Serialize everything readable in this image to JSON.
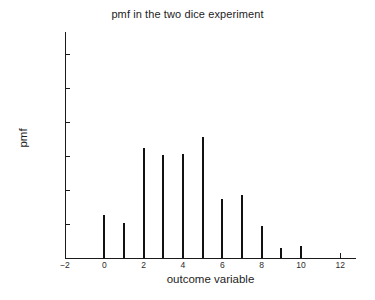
{
  "chart_data": {
    "type": "bar",
    "title": "pmf in the two dice experiment",
    "xlabel": "outcome variable",
    "ylabel": "pmf",
    "categories": [
      0,
      1,
      2,
      3,
      4,
      5,
      6,
      7,
      8,
      9,
      10
    ],
    "values": [
      0.063,
      0.051,
      0.162,
      0.152,
      0.153,
      0.178,
      0.087,
      0.092,
      0.047,
      0.015,
      0.017
    ],
    "series": [
      {
        "name": "pmf",
        "values": [
          0.063,
          0.051,
          0.162,
          0.152,
          0.153,
          0.178,
          0.087,
          0.092,
          0.047,
          0.015,
          0.017
        ]
      }
    ],
    "xlim": [
      -2,
      12.8
    ],
    "ylim": [
      0,
      0.332
    ],
    "xticks": [
      -2,
      0,
      2,
      4,
      6,
      8,
      10,
      12
    ],
    "xtick_labels": [
      "−2",
      "0",
      "2",
      "4",
      "6",
      "8",
      "10",
      "12"
    ],
    "yticks": [
      0,
      0.05,
      0.1,
      0.15,
      0.2,
      0.25,
      0.3
    ],
    "ytick_labels": [
      "0",
      "0.05",
      "0.1",
      "0.15",
      "0.2",
      "0.25",
      "0.3"
    ],
    "grid": false,
    "legend": false,
    "marker_style": "stem",
    "colors": {
      "stem": "#111111",
      "axis": "#1a1a1a",
      "text": "#1d1d1d",
      "background": "#ffffff"
    }
  }
}
